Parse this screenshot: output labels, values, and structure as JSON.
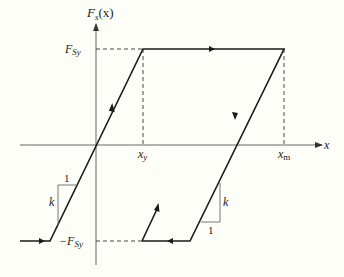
{
  "diagram": {
    "type": "hysteresis-force-displacement",
    "y_axis_label": "F_s(x)",
    "y_axis_label_main": "F",
    "y_axis_label_sub": "s",
    "y_axis_label_arg": "(x)",
    "x_axis_label": "x",
    "labels": {
      "fsy_main": "F",
      "fsy_sub": "Sy",
      "neg_fsy_prefix": "−F",
      "neg_fsy_sub": "Sy",
      "xy_main": "x",
      "xy_sub": "y",
      "xm_main": "x",
      "xm_sub": "m",
      "k_left": "k",
      "one_left": "1",
      "k_right": "k",
      "one_right": "1"
    },
    "colors": {
      "background": "#fefef9",
      "curve": "#1a1a1a",
      "axis": "#555555",
      "dashed": "#333333"
    }
  }
}
